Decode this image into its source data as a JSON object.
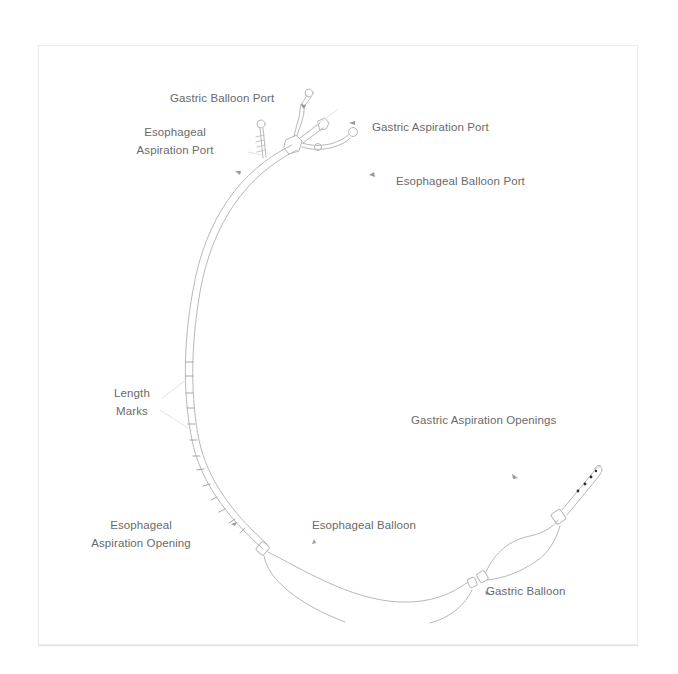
{
  "diagram": {
    "type": "medical-device-illustration",
    "colors": {
      "background": "#ffffff",
      "line": "#b5b5b5",
      "label_text": "#6a6a6a",
      "arrow": "#9a9a9a",
      "frame_border": "#ececec",
      "aspiration_dots": "#333333"
    },
    "labels": {
      "gastric_balloon_port": "Gastric Balloon Port",
      "esophageal_aspiration_port": {
        "line1": "Esophageal",
        "line2": "Aspiration Port"
      },
      "gastric_aspiration_port": "Gastric Aspiration Port",
      "esophageal_balloon_port": "Esophageal Balloon Port",
      "length_marks": {
        "line1": "Length",
        "line2": "Marks"
      },
      "gastric_aspiration_openings": "Gastric Aspiration Openings",
      "esophageal_aspiration_opening": {
        "line1": "Esophageal",
        "line2": "Aspiration Opening"
      },
      "esophageal_balloon": "Esophageal Balloon",
      "gastric_balloon": "Gastric Balloon"
    }
  }
}
